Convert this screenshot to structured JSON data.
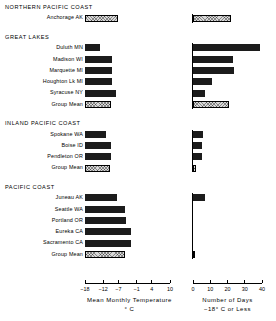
{
  "chart_data": {
    "type": "bar",
    "orientation": "horizontal",
    "title": "",
    "panels": [
      {
        "id": "left",
        "xlabel_line1": "Mean Monthly Temperature",
        "xlabel_line2": "° C",
        "ticks": [
          -18,
          -12,
          -7,
          -1,
          4,
          10
        ],
        "tick_labels": [
          "−18",
          "−12",
          "−7",
          "−1",
          "4",
          "10"
        ],
        "xlim": [
          -18,
          10
        ],
        "grid": false
      },
      {
        "id": "right",
        "xlabel_line1": "Number of Days",
        "xlabel_line2": "−18° C or Less",
        "ticks": [
          0,
          10,
          20,
          30,
          40
        ],
        "tick_labels": [
          "0",
          "10",
          "20",
          "30",
          "40"
        ],
        "xlim": [
          0,
          40
        ],
        "grid": false
      }
    ],
    "groups": [
      {
        "name": "NORTHERN PACIFIC COAST",
        "rows": [
          {
            "label": "Anchorage AK",
            "style": "hatch",
            "temperature": -7.0,
            "days": 22
          }
        ]
      },
      {
        "name": "GREAT LAKES",
        "rows": [
          {
            "label": "Duluth MN",
            "style": "solid",
            "temperature": -13.0,
            "days": 39
          },
          {
            "label": "Madison WI",
            "style": "solid",
            "temperature": -9.0,
            "days": 23
          },
          {
            "label": "Marquette MI",
            "style": "solid",
            "temperature": -9.0,
            "days": 24
          },
          {
            "label": "Houghton Lk MI",
            "style": "solid",
            "temperature": -9.1,
            "days": 11
          },
          {
            "label": "Syracuse NY",
            "style": "solid",
            "temperature": -7.8,
            "days": 7
          },
          {
            "label": "Group Mean",
            "style": "hatch",
            "temperature": -9.6,
            "days": 21
          }
        ]
      },
      {
        "name": "INLAND PACIFIC COAST",
        "rows": [
          {
            "label": "Spokane WA",
            "style": "solid",
            "temperature": -11.0,
            "days": 6
          },
          {
            "label": "Boise ID",
            "style": "solid",
            "temperature": -9.5,
            "days": 5
          },
          {
            "label": "Pendleton OR",
            "style": "solid",
            "temperature": -9.3,
            "days": 5
          },
          {
            "label": "Group Mean",
            "style": "hatch",
            "temperature": -9.9,
            "days": 2
          }
        ]
      },
      {
        "name": "PACIFIC COAST",
        "rows": [
          {
            "label": "Juneau AK",
            "style": "solid",
            "temperature": -7.5,
            "days": 7
          },
          {
            "label": "Seattle WA",
            "style": "solid",
            "temperature": -4.8,
            "days": 0
          },
          {
            "label": "Portland OR",
            "style": "solid",
            "temperature": -4.6,
            "days": 0
          },
          {
            "label": "Eureka CA",
            "style": "solid",
            "temperature": -3.0,
            "days": 0
          },
          {
            "label": "Sacramento CA",
            "style": "solid",
            "temperature": -3.0,
            "days": 0
          },
          {
            "label": "Group Mean",
            "style": "hatch",
            "temperature": -4.7,
            "days": 1
          }
        ]
      }
    ]
  }
}
